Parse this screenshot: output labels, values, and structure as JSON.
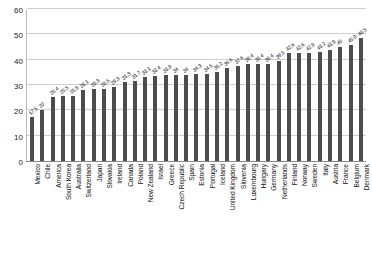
{
  "chart_data": {
    "type": "bar",
    "title": "",
    "xlabel": "",
    "ylabel": "",
    "ylim": [
      0,
      60
    ],
    "yticks": [
      0,
      10,
      20,
      30,
      40,
      50,
      60
    ],
    "grid": true,
    "legend": false,
    "bar_color": "#4d4d4d",
    "categories": [
      "Mexico",
      "Chile",
      "America",
      "South Korea",
      "Australia",
      "Switzerland",
      "Japan",
      "Slovakia",
      "Ireland",
      "Canada",
      "Poland",
      "New Zealand",
      "Israel",
      "Greece",
      "Czech Republic",
      "Spain",
      "Estonia",
      "Portugal",
      "Iceland",
      "United Kingdom",
      "Slovenia",
      "Luxembourg",
      "Hungary",
      "Germany",
      "Netherlands",
      "Finland",
      "Norway",
      "Sweden",
      "Italy",
      "Austria",
      "France",
      "Belgium",
      "Denmark"
    ],
    "values": [
      17.5,
      20,
      25.4,
      25.5,
      25.8,
      28.1,
      28.3,
      28.5,
      29.3,
      31.3,
      31.7,
      33.1,
      33.4,
      33.9,
      34,
      34,
      34.3,
      34.5,
      35.2,
      36.6,
      37.6,
      38.4,
      38.4,
      38.4,
      39.5,
      42.6,
      42.6,
      42.8,
      43.2,
      43.8,
      45,
      45.9,
      48.5
    ],
    "value_labels": [
      "17.5",
      "20",
      "25.4",
      "25.5",
      "25.8",
      "28.1",
      "28.3",
      "28.5",
      "29.3",
      "31.3",
      "31.7",
      "33.1",
      "33.4",
      "33.9",
      "34",
      "34",
      "34.3",
      "34.5",
      "35.2",
      "36.6",
      "37.6",
      "38.4",
      "38.4",
      "38.4",
      "39.5",
      "42.6",
      "42.6",
      "42.8",
      "43.2",
      "43.8",
      "45",
      "45.9",
      "48.5"
    ]
  }
}
